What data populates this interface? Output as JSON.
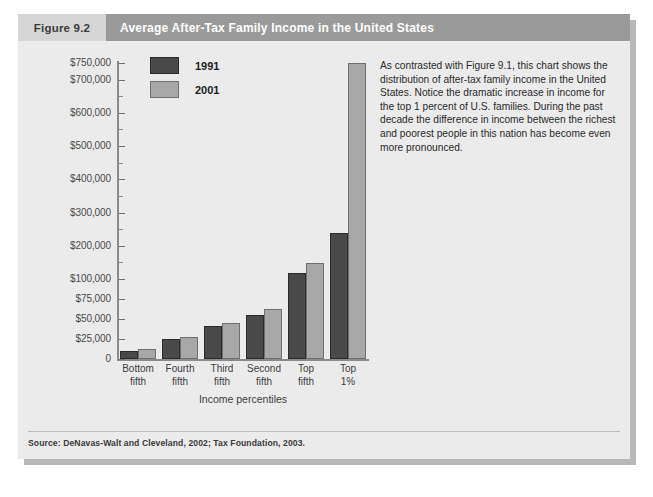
{
  "figure": {
    "number": "Figure 9.2",
    "title": "Average After-Tax Family Income in the United States",
    "source": "Source: DeNavas-Walt and Cleveland, 2002; Tax Foundation, 2003.",
    "caption": "As contrasted with Figure 9.1, this chart shows the distribution of after-tax family income in the United States. Notice the dramatic increase in income for the top 1 percent of U.S. families. During the past decade the difference in income between the richest and poorest people in this nation has become even more pronounced."
  },
  "colors": {
    "header_number_bg": "#d6d6d6",
    "header_title_bg": "#9a9a9a",
    "panel_bg": "#ebebeb",
    "series_1991": "#494949",
    "series_2001": "#a8a8a8",
    "axis": "#8a8a8a"
  },
  "chart_data": {
    "type": "bar",
    "title": "Average After-Tax Family Income in the United States",
    "xlabel": "Income percentiles",
    "ylabel": "",
    "categories": [
      "Bottom fifth",
      "Fourth fifth",
      "Third fifth",
      "Second fifth",
      "Top fifth",
      "Top 1%"
    ],
    "category_lines": [
      [
        "Bottom",
        "fifth"
      ],
      [
        "Fourth",
        "fifth"
      ],
      [
        "Third",
        "fifth"
      ],
      [
        "Second",
        "fifth"
      ],
      [
        "Top",
        "fifth"
      ],
      [
        "Top",
        "1%"
      ]
    ],
    "series": [
      {
        "name": "1991",
        "color": "#494949",
        "values": [
          10000,
          25000,
          41000,
          55000,
          118000,
          238000
        ]
      },
      {
        "name": "2001",
        "color": "#a8a8a8",
        "values": [
          13000,
          28000,
          45000,
          62000,
          148000,
          750000
        ]
      }
    ],
    "legend": [
      "1991",
      "2001"
    ],
    "legend_position": "top-center",
    "grid": false,
    "y_axis_note": "broken / compressed scale: $0-$100,000 in $25,000 steps, then $100,000-$750,000 in $100,000 steps",
    "y_tick_labels": [
      "0",
      "$25,000",
      "$50,000",
      "$75,000",
      "$100,000",
      "$200,000",
      "$300,000",
      "$400,000",
      "$500,000",
      "$600,000",
      "$700,000",
      "$750,000"
    ],
    "y_tick_values": [
      0,
      25000,
      50000,
      75000,
      100000,
      200000,
      300000,
      400000,
      500000,
      600000,
      700000,
      750000
    ],
    "ylim": [
      0,
      750000
    ]
  }
}
